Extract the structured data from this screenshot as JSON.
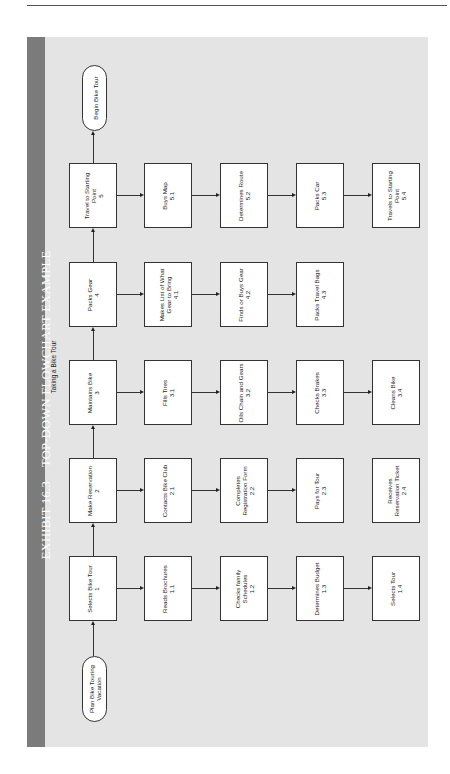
{
  "exhibit": {
    "number": "EXHIBIT 16.3",
    "title": "TOP-DOWN FLOWCHART EXAMPLE",
    "subtitle": "Taking a Bike Tour"
  },
  "terminals": {
    "start": "Plan Bike Touring Vacation",
    "end": "Begin Bike Tour"
  },
  "steps": [
    {
      "id": "1",
      "label": "Selects Bike Tour",
      "number": "1",
      "substeps": [
        {
          "label": "Reads Brochures",
          "number": "1.1"
        },
        {
          "label": "Checks family Schedules",
          "number": "1.2"
        },
        {
          "label": "Determines Budget",
          "number": "1.3"
        },
        {
          "label": "Selects Tour",
          "number": "1.4"
        }
      ],
      "arrows_between_substeps": [
        true,
        true,
        true
      ]
    },
    {
      "id": "2",
      "label": "Make Reservation",
      "number": "2",
      "substeps": [
        {
          "label": "Contacts Bike Club",
          "number": "2.1"
        },
        {
          "label": "Completes Registration Form",
          "number": "2.2"
        },
        {
          "label": "Pays for Tour",
          "number": "2.3"
        },
        {
          "label": "Receives Reservation Ticket",
          "number": "2.4"
        }
      ],
      "arrows_between_substeps": [
        true,
        true,
        false
      ]
    },
    {
      "id": "3",
      "label": "Maintains Bike",
      "number": "3",
      "substeps": [
        {
          "label": "Fills Tires",
          "number": "3.1"
        },
        {
          "label": "Oils Chain and Gears",
          "number": "3.2"
        },
        {
          "label": "Checks Brakes",
          "number": "3.3"
        },
        {
          "label": "Cleans Bike",
          "number": "3.4"
        }
      ],
      "arrows_between_substeps": [
        true,
        true,
        true
      ]
    },
    {
      "id": "4",
      "label": "Packs Gear",
      "number": "4",
      "substeps": [
        {
          "label": "Makes List of What Gear to Bring",
          "number": "4.1"
        },
        {
          "label": "Finds or Buys Gear",
          "number": "4.2"
        },
        {
          "label": "Packs Travel Bags",
          "number": "4.3"
        }
      ],
      "arrows_between_substeps": [
        true,
        true
      ]
    },
    {
      "id": "5",
      "label": "Travel to Starting Point",
      "number": "5",
      "substeps": [
        {
          "label": "Buys Map",
          "number": "5.1"
        },
        {
          "label": "Determines Route",
          "number": "5.2"
        },
        {
          "label": "Packs Car",
          "number": "5.3"
        },
        {
          "label": "Travels to Starting Point",
          "number": "5.4"
        }
      ],
      "arrows_between_substeps": [
        true,
        true,
        true
      ]
    }
  ],
  "colors": {
    "panel": "#e4e4e4",
    "title_bar": "#7b7b7b",
    "box_fill": "#ffffff",
    "stroke": "#333333"
  }
}
